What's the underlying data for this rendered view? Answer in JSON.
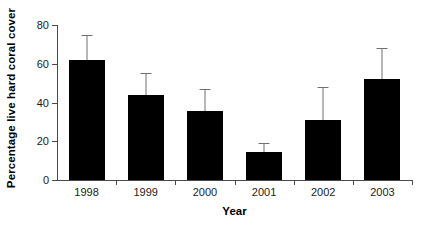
{
  "chart_data": {
    "type": "bar",
    "title": "",
    "xlabel": "Year",
    "ylabel": "Percentage live hard coral cover",
    "categories": [
      "1998",
      "1999",
      "2000",
      "2001",
      "2002",
      "2003"
    ],
    "values": [
      62,
      44,
      35.5,
      14.5,
      31,
      52
    ],
    "error_upper": [
      75,
      55,
      47,
      19,
      48,
      68
    ],
    "series": [
      {
        "name": "Percentage live hard coral cover",
        "values": [
          62,
          44,
          35.5,
          14.5,
          31,
          52
        ]
      }
    ],
    "ylim": [
      0,
      80
    ],
    "yticks": [
      0,
      20,
      40,
      60,
      80
    ],
    "ytick_labels": [
      "0",
      "20",
      "40",
      "60",
      "80"
    ],
    "grid": false,
    "legend": false,
    "legend_position": "none",
    "bar_color": "#000000",
    "error_bar_color": "#707070",
    "axis_color": "#4a4a4a",
    "error_bar_style": "upper-only-with-cap",
    "annotations": []
  },
  "axes": {
    "y_title": "Percentage live hard coral cover",
    "x_title": "Year"
  }
}
